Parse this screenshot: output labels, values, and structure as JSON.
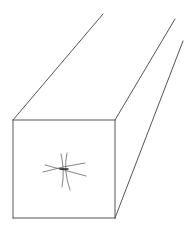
{
  "figure": {
    "stroke_color": "#555555",
    "background": "#ffffff",
    "front_face": {
      "top_left": [
        13,
        120
      ],
      "top_right": [
        115,
        120
      ],
      "bottom_right": [
        115,
        218
      ],
      "bottom_left": [
        13,
        218
      ]
    },
    "receding_edges": [
      {
        "from": [
          13,
          120
        ],
        "to": [
          103,
          14
        ]
      },
      {
        "from": [
          115,
          120
        ],
        "to": [
          175,
          19
        ]
      },
      {
        "from": [
          115,
          218
        ],
        "to": [
          183,
          41
        ]
      }
    ],
    "center_mark": {
      "center": [
        64,
        169
      ],
      "shape": "star-asterisk",
      "color": "#666666"
    }
  }
}
